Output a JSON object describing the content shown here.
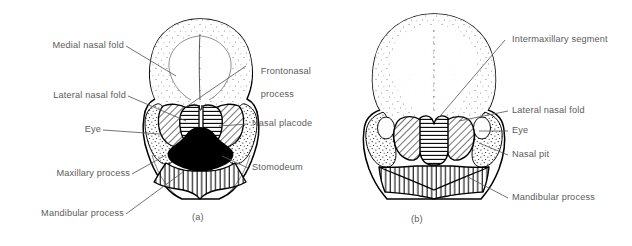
{
  "figure": {
    "background_color": "#ffffff",
    "ink_color": "#000000",
    "label_color": "#5b5b5b"
  },
  "panels": [
    {
      "id": "a",
      "caption": "(a)",
      "labels_left": [
        {
          "key": "medial_nasal_fold",
          "text": "Medial nasal fold"
        },
        {
          "key": "lateral_nasal_fold",
          "text": "Lateral nasal fold"
        },
        {
          "key": "eye",
          "text": "Eye"
        },
        {
          "key": "maxillary_process",
          "text": "Maxillary process"
        },
        {
          "key": "mandibular_process",
          "text": "Mandibular process"
        }
      ],
      "labels_right": [
        {
          "key": "frontonasal_process",
          "text_line1": "Frontonasal",
          "text_line2": "process"
        },
        {
          "key": "nasal_placode",
          "text": "Nasal placode"
        },
        {
          "key": "stomodeum",
          "text": "Stomodeum"
        }
      ]
    },
    {
      "id": "b",
      "caption": "(b)",
      "labels_right": [
        {
          "key": "intermaxillary_segment",
          "text": "Intermaxillary segment"
        },
        {
          "key": "lateral_nasal_fold",
          "text": "Lateral nasal fold"
        },
        {
          "key": "eye",
          "text": "Eye"
        },
        {
          "key": "nasal_pit",
          "text": "Nasal pit"
        },
        {
          "key": "mandibular_process",
          "text": "Mandibular process"
        }
      ]
    }
  ]
}
